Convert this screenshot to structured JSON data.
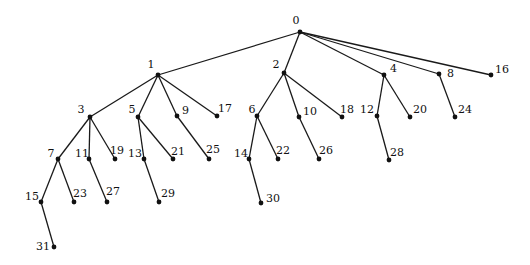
{
  "diagram": {
    "type": "tree",
    "style": {
      "edge_color": "#1a1a1a",
      "node_color": "#111111",
      "background": "#ffffff"
    },
    "nodes": [
      {
        "id": "0",
        "label": "0",
        "x": 300,
        "y": 32,
        "lx": 296,
        "ly": 24,
        "anchor": "middle"
      },
      {
        "id": "1",
        "label": "1",
        "x": 158,
        "y": 75,
        "lx": 151,
        "ly": 68,
        "anchor": "middle"
      },
      {
        "id": "2",
        "label": "2",
        "x": 284,
        "y": 73,
        "lx": 276,
        "ly": 68,
        "anchor": "middle"
      },
      {
        "id": "4",
        "label": "4",
        "x": 384,
        "y": 75,
        "lx": 390,
        "ly": 72,
        "anchor": "start"
      },
      {
        "id": "8",
        "label": "8",
        "x": 439,
        "y": 74,
        "lx": 447,
        "ly": 77,
        "anchor": "start"
      },
      {
        "id": "16",
        "label": "16",
        "x": 491,
        "y": 75,
        "lx": 495,
        "ly": 73,
        "anchor": "start"
      },
      {
        "id": "3",
        "label": "3",
        "x": 90,
        "y": 117,
        "lx": 81,
        "ly": 113,
        "anchor": "middle"
      },
      {
        "id": "5",
        "label": "5",
        "x": 138,
        "y": 117,
        "lx": 132,
        "ly": 113,
        "anchor": "middle"
      },
      {
        "id": "9",
        "label": "9",
        "x": 177,
        "y": 116,
        "lx": 182,
        "ly": 114,
        "anchor": "start"
      },
      {
        "id": "17",
        "label": "17",
        "x": 217,
        "y": 116,
        "lx": 218,
        "ly": 112,
        "anchor": "start"
      },
      {
        "id": "6",
        "label": "6",
        "x": 257,
        "y": 116,
        "lx": 252,
        "ly": 113,
        "anchor": "middle"
      },
      {
        "id": "10",
        "label": "10",
        "x": 299,
        "y": 117,
        "lx": 303,
        "ly": 115,
        "anchor": "start"
      },
      {
        "id": "18",
        "label": "18",
        "x": 342,
        "y": 117,
        "lx": 340,
        "ly": 113,
        "anchor": "start"
      },
      {
        "id": "12",
        "label": "12",
        "x": 377,
        "y": 116,
        "lx": 367,
        "ly": 113,
        "anchor": "middle"
      },
      {
        "id": "20",
        "label": "20",
        "x": 410,
        "y": 117,
        "lx": 413,
        "ly": 113,
        "anchor": "start"
      },
      {
        "id": "24",
        "label": "24",
        "x": 455,
        "y": 117,
        "lx": 458,
        "ly": 113,
        "anchor": "start"
      },
      {
        "id": "7",
        "label": "7",
        "x": 58,
        "y": 159,
        "lx": 51,
        "ly": 157,
        "anchor": "middle"
      },
      {
        "id": "11",
        "label": "11",
        "x": 89,
        "y": 159,
        "lx": 82,
        "ly": 157,
        "anchor": "middle"
      },
      {
        "id": "19",
        "label": "19",
        "x": 115,
        "y": 159,
        "lx": 110,
        "ly": 154,
        "anchor": "start"
      },
      {
        "id": "13",
        "label": "13",
        "x": 144,
        "y": 159,
        "lx": 135,
        "ly": 157,
        "anchor": "middle"
      },
      {
        "id": "21",
        "label": "21",
        "x": 173,
        "y": 159,
        "lx": 171,
        "ly": 155,
        "anchor": "start"
      },
      {
        "id": "25",
        "label": "25",
        "x": 209,
        "y": 159,
        "lx": 206,
        "ly": 153,
        "anchor": "start"
      },
      {
        "id": "14",
        "label": "14",
        "x": 249,
        "y": 159,
        "lx": 241,
        "ly": 157,
        "anchor": "middle"
      },
      {
        "id": "22",
        "label": "22",
        "x": 278,
        "y": 159,
        "lx": 276,
        "ly": 154,
        "anchor": "start"
      },
      {
        "id": "26",
        "label": "26",
        "x": 319,
        "y": 159,
        "lx": 319,
        "ly": 154,
        "anchor": "start"
      },
      {
        "id": "28",
        "label": "28",
        "x": 389,
        "y": 160,
        "lx": 390,
        "ly": 156,
        "anchor": "start"
      },
      {
        "id": "15",
        "label": "15",
        "x": 41,
        "y": 202,
        "lx": 32,
        "ly": 200,
        "anchor": "middle"
      },
      {
        "id": "23",
        "label": "23",
        "x": 74,
        "y": 202,
        "lx": 73,
        "ly": 197,
        "anchor": "start"
      },
      {
        "id": "27",
        "label": "27",
        "x": 107,
        "y": 202,
        "lx": 106,
        "ly": 195,
        "anchor": "start"
      },
      {
        "id": "29",
        "label": "29",
        "x": 159,
        "y": 202,
        "lx": 161,
        "ly": 197,
        "anchor": "start"
      },
      {
        "id": "30",
        "label": "30",
        "x": 261,
        "y": 203,
        "lx": 266,
        "ly": 202,
        "anchor": "start"
      },
      {
        "id": "31",
        "label": "31",
        "x": 54,
        "y": 247,
        "lx": 43,
        "ly": 250,
        "anchor": "middle"
      }
    ],
    "edges": [
      [
        "0",
        "1"
      ],
      [
        "0",
        "2"
      ],
      [
        "0",
        "4"
      ],
      [
        "0",
        "8"
      ],
      [
        "0",
        "16"
      ],
      [
        "1",
        "3"
      ],
      [
        "1",
        "5"
      ],
      [
        "1",
        "9"
      ],
      [
        "1",
        "17"
      ],
      [
        "2",
        "6"
      ],
      [
        "2",
        "10"
      ],
      [
        "2",
        "18"
      ],
      [
        "4",
        "12"
      ],
      [
        "4",
        "20"
      ],
      [
        "8",
        "24"
      ],
      [
        "3",
        "7"
      ],
      [
        "3",
        "11"
      ],
      [
        "3",
        "19"
      ],
      [
        "5",
        "13"
      ],
      [
        "5",
        "21"
      ],
      [
        "9",
        "25"
      ],
      [
        "6",
        "14"
      ],
      [
        "6",
        "22"
      ],
      [
        "10",
        "26"
      ],
      [
        "12",
        "28"
      ],
      [
        "7",
        "15"
      ],
      [
        "7",
        "23"
      ],
      [
        "11",
        "27"
      ],
      [
        "13",
        "29"
      ],
      [
        "14",
        "30"
      ],
      [
        "15",
        "31"
      ]
    ]
  }
}
